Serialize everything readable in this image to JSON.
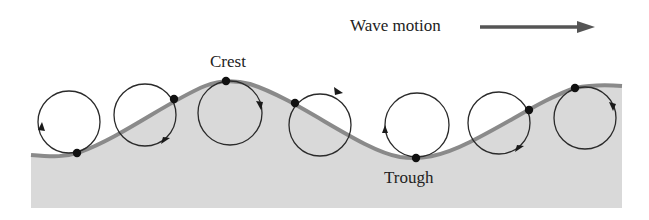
{
  "labels": {
    "wave_motion": "Wave motion",
    "crest": "Crest",
    "trough": "Trough"
  },
  "colors": {
    "water_fill": "#d9d9d9",
    "wave_line": "#8a8a8a",
    "orbit_stroke": "#2a2a2a",
    "particle": "#111111",
    "motion_arrow": "#555555",
    "text": "#222222"
  },
  "orbits": [
    {
      "cx": 69,
      "cy": 122,
      "r": 31,
      "particle": [
        77,
        153
      ],
      "arrow": "left-side-up"
    },
    {
      "cx": 145,
      "cy": 115,
      "r": 31,
      "particle": [
        174,
        99
      ],
      "arrow": "bottom-right-left"
    },
    {
      "cx": 230,
      "cy": 113,
      "r": 32,
      "particle": [
        226,
        81
      ],
      "arrow": "right-side-down"
    },
    {
      "cx": 320,
      "cy": 125,
      "r": 31,
      "particle": [
        295,
        103
      ],
      "arrow": "top-right"
    },
    {
      "cx": 417,
      "cy": 125,
      "r": 32,
      "particle": [
        416,
        158
      ],
      "arrow": "left-side-up"
    },
    {
      "cx": 499,
      "cy": 123,
      "r": 31,
      "particle": [
        529,
        110
      ],
      "arrow": "bottom-right-left"
    },
    {
      "cx": 585,
      "cy": 118,
      "r": 31,
      "particle": [
        575,
        88
      ],
      "arrow": "right-side-down"
    }
  ]
}
